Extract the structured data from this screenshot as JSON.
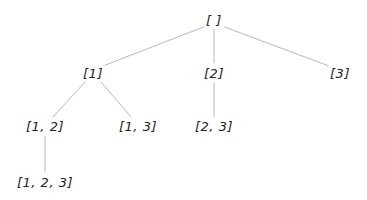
{
  "diagram": {
    "type": "tree",
    "colors": {
      "edge": "#b8b8b8",
      "text": "#222222",
      "background": "#ffffff"
    },
    "nodes": [
      {
        "id": "root",
        "label": "[ ]",
        "x": 214,
        "y": 20
      },
      {
        "id": "n1",
        "label": "[1]",
        "x": 93,
        "y": 73
      },
      {
        "id": "n2",
        "label": "[2]",
        "x": 214,
        "y": 73
      },
      {
        "id": "n3",
        "label": "[3]",
        "x": 340,
        "y": 73
      },
      {
        "id": "n12",
        "label": "[1, 2]",
        "x": 45,
        "y": 126
      },
      {
        "id": "n13",
        "label": "[1, 3]",
        "x": 138,
        "y": 126
      },
      {
        "id": "n23",
        "label": "[2, 3]",
        "x": 214,
        "y": 126
      },
      {
        "id": "n123",
        "label": "[1, 2, 3]",
        "x": 45,
        "y": 182
      }
    ],
    "edges": [
      {
        "from": "root",
        "to": "n1"
      },
      {
        "from": "root",
        "to": "n2"
      },
      {
        "from": "root",
        "to": "n3"
      },
      {
        "from": "n1",
        "to": "n12"
      },
      {
        "from": "n1",
        "to": "n13"
      },
      {
        "from": "n2",
        "to": "n23"
      },
      {
        "from": "n12",
        "to": "n123"
      }
    ]
  }
}
